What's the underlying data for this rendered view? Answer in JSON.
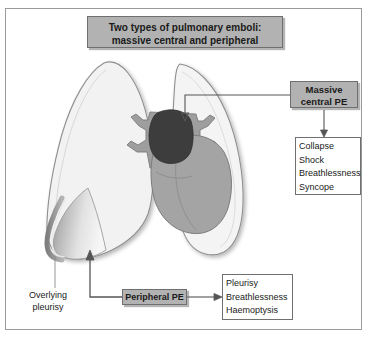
{
  "figure": {
    "title_lines": [
      "Two types of pulmonary emboli:",
      "massive central and peripheral"
    ],
    "colors": {
      "frame_border": "#9a9a9a",
      "box_gray_fill": "#b2b2b2",
      "box_border": "#6f6f6f",
      "lung_fill": "#f2f2f2",
      "lung_outline": "#8f8f8f",
      "heart_fill": "#a4a4a4",
      "artery_fill": "#9e9e9e",
      "embolus_fill": "#3d3d3d",
      "infarct_edge": "#9d9d9d",
      "connector": "#555555"
    },
    "massive_central": {
      "label_lines": [
        "Massive",
        "central PE"
      ],
      "symptoms": [
        "Collapse",
        "Shock",
        "Breathlessness",
        "Syncope"
      ]
    },
    "peripheral": {
      "label": "Peripheral PE",
      "symptoms": [
        "Pleurisy",
        "Breathlessness",
        "Haemoptysis"
      ]
    },
    "overlying_pleurisy": {
      "label_lines": [
        "Overlying",
        "pleurisy"
      ]
    },
    "anatomy": {
      "left_lung": "left-lung",
      "right_lung": "right-lung",
      "heart": "heart",
      "pulmonary_artery": "pulmonary-artery",
      "central_embolus": "central-embolus",
      "peripheral_infarct": "peripheral-infarct-wedge",
      "pleural_rim": "pleural-rim"
    }
  }
}
